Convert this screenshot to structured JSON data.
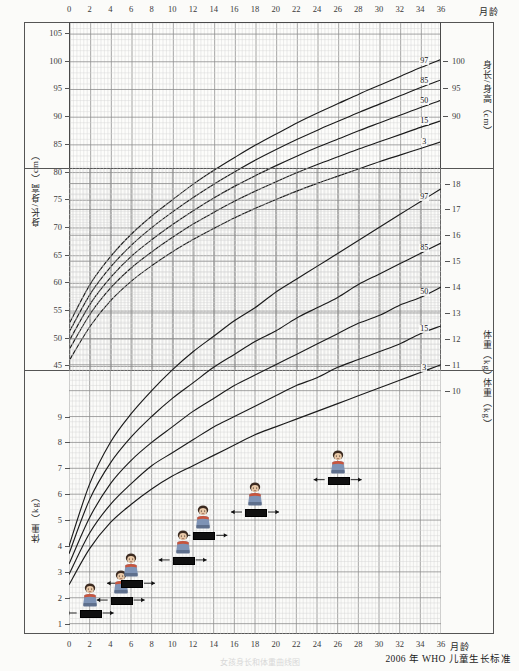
{
  "document": {
    "footer_note": "2006 年 WHO 儿童生长标准",
    "faint_caption": "女孩身长和体重曲线图"
  },
  "axes": {
    "x_label": "月龄",
    "x_ticks": [
      0,
      2,
      4,
      6,
      8,
      10,
      12,
      14,
      16,
      18,
      20,
      22,
      24,
      26,
      28,
      30,
      32,
      34,
      36
    ],
    "x_min": 0,
    "x_max": 36,
    "height_axis_label_left": "身长/身高（cm）",
    "height_axis_label_right": "身长/身高（cm）",
    "height_ticks_left": [
      45,
      50,
      55,
      60,
      65,
      70,
      75,
      80,
      85,
      90,
      95,
      100,
      105
    ],
    "height_ticks_right": [
      90,
      95,
      100
    ],
    "height_min": 44,
    "height_max": 107,
    "weight_axis_label_left": "体重（kg）",
    "weight_axis_label_right_upper": "体重（kg）",
    "weight_axis_label_right_lower": "体重（kg）",
    "weight_ticks_left": [
      1,
      2,
      3,
      4,
      5,
      6,
      7,
      8,
      9
    ],
    "weight_ticks_right_upper": [
      10,
      11,
      12,
      13,
      14,
      15,
      16,
      17,
      18
    ],
    "weight_ticks_right_lower": [
      2,
      3,
      4,
      5,
      6,
      7,
      8,
      9,
      10
    ],
    "weight_min": 0.6,
    "weight_max": 18.6
  },
  "percentile_labels": {
    "height": [
      "97",
      "85",
      "50",
      "15",
      "3"
    ],
    "weight": [
      "97",
      "85",
      "50",
      "15",
      "3"
    ]
  },
  "chart_data": {
    "type": "line",
    "title": "2006 年 WHO 儿童生长标准",
    "xlabel": "月龄",
    "charts": [
      {
        "name": "length-height-for-age",
        "ylabel": "身长/身高（cm）",
        "xlim": [
          0,
          36
        ],
        "ylim": [
          44,
          107
        ],
        "x": [
          0,
          2,
          4,
          6,
          8,
          10,
          12,
          14,
          16,
          18,
          20,
          22,
          24,
          26,
          28,
          30,
          32,
          34,
          36
        ],
        "grid": true,
        "series": [
          {
            "name": "97",
            "values": [
              53.0,
              60.0,
              65.0,
              69.0,
              72.3,
              75.2,
              78.0,
              80.5,
              82.8,
              85.0,
              87.0,
              89.0,
              90.8,
              92.5,
              94.2,
              95.8,
              97.4,
              99.0,
              100.5
            ]
          },
          {
            "name": "85",
            "values": [
              51.5,
              58.2,
              63.1,
              67.0,
              70.2,
              73.0,
              75.6,
              78.0,
              80.2,
              82.3,
              84.2,
              86.0,
              87.7,
              89.3,
              90.9,
              92.4,
              93.9,
              95.4,
              96.8
            ]
          },
          {
            "name": "50",
            "values": [
              49.9,
              56.4,
              61.2,
              65.0,
              68.0,
              70.7,
              73.2,
              75.5,
              77.6,
              79.5,
              81.3,
              83.0,
              84.6,
              86.1,
              87.6,
              89.0,
              90.4,
              91.8,
              93.1
            ]
          },
          {
            "name": "15",
            "values": [
              48.3,
              54.6,
              59.3,
              62.9,
              65.8,
              68.4,
              70.8,
              72.9,
              74.9,
              76.7,
              78.4,
              80.0,
              81.5,
              82.9,
              84.3,
              85.6,
              86.9,
              88.2,
              89.4
            ]
          },
          {
            "name": "3",
            "values": [
              46.3,
              52.4,
              57.0,
              60.5,
              63.3,
              65.8,
              68.0,
              70.0,
              71.9,
              73.6,
              75.2,
              76.7,
              78.1,
              79.4,
              80.7,
              82.0,
              83.2,
              84.4,
              85.6
            ]
          }
        ]
      },
      {
        "name": "weight-for-age",
        "ylabel": "体重（kg）",
        "xlim": [
          0,
          36
        ],
        "ylim": [
          0.6,
          18.6
        ],
        "x": [
          0,
          2,
          4,
          6,
          8,
          10,
          12,
          14,
          16,
          18,
          20,
          22,
          24,
          26,
          28,
          30,
          32,
          34,
          36
        ],
        "grid": true,
        "series": [
          {
            "name": "97",
            "values": [
              4.0,
              6.4,
              8.0,
              9.1,
              10.0,
              10.8,
              11.5,
              12.1,
              12.7,
              13.2,
              13.8,
              14.3,
              14.8,
              15.3,
              15.8,
              16.3,
              16.8,
              17.3,
              17.8
            ]
          },
          {
            "name": "85",
            "values": [
              3.7,
              5.8,
              7.2,
              8.2,
              9.0,
              9.7,
              10.3,
              10.9,
              11.4,
              11.9,
              12.3,
              12.8,
              13.2,
              13.6,
              14.1,
              14.5,
              14.9,
              15.3,
              15.7
            ]
          },
          {
            "name": "50",
            "values": [
              3.3,
              5.1,
              6.4,
              7.3,
              8.0,
              8.6,
              9.2,
              9.7,
              10.2,
              10.6,
              11.0,
              11.4,
              11.8,
              12.2,
              12.6,
              12.9,
              13.3,
              13.6,
              14.0
            ]
          },
          {
            "name": "15",
            "values": [
              2.9,
              4.5,
              5.6,
              6.4,
              7.1,
              7.6,
              8.1,
              8.6,
              9.0,
              9.4,
              9.8,
              10.2,
              10.5,
              10.9,
              11.2,
              11.5,
              11.8,
              12.2,
              12.5
            ]
          },
          {
            "name": "3",
            "values": [
              2.5,
              3.9,
              4.9,
              5.6,
              6.2,
              6.7,
              7.1,
              7.5,
              7.9,
              8.3,
              8.6,
              8.9,
              9.2,
              9.5,
              9.8,
              10.1,
              10.4,
              10.7,
              11.0
            ]
          }
        ]
      }
    ]
  },
  "growth_markers": [
    {
      "label": "",
      "month": 2,
      "weight": 1.45
    },
    {
      "label": "",
      "month": 5,
      "weight": 1.95
    },
    {
      "label": "",
      "month": 6,
      "weight": 2.6
    },
    {
      "label": "",
      "month": 11,
      "weight": 3.5
    },
    {
      "label": "",
      "month": 13,
      "weight": 4.45
    },
    {
      "label": "",
      "month": 18,
      "weight": 5.35
    },
    {
      "label": "",
      "month": 26,
      "weight": 6.6
    }
  ]
}
